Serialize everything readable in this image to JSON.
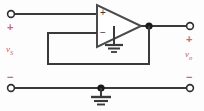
{
  "figure": {
    "wire_color": "#3a3a3a",
    "label_color": "#c9566f",
    "background": "#fdfdfd"
  },
  "input_port": {
    "plus_sign": "+",
    "minus_sign": "−",
    "source_label": "v",
    "source_subscript": "S"
  },
  "output_port": {
    "plus_sign": "+",
    "minus_sign": "−",
    "output_label": "v",
    "output_subscript": "o"
  },
  "opamp": {
    "noninverting_sign": "+",
    "inverting_sign": "−",
    "name": "operational-amplifier"
  },
  "nodes": {
    "output_junction": "output-node",
    "ground_junction": "ground-node"
  },
  "grounds": {
    "opamp_ground": "opamp-ground-symbol",
    "rail_ground": "rail-ground-symbol"
  }
}
